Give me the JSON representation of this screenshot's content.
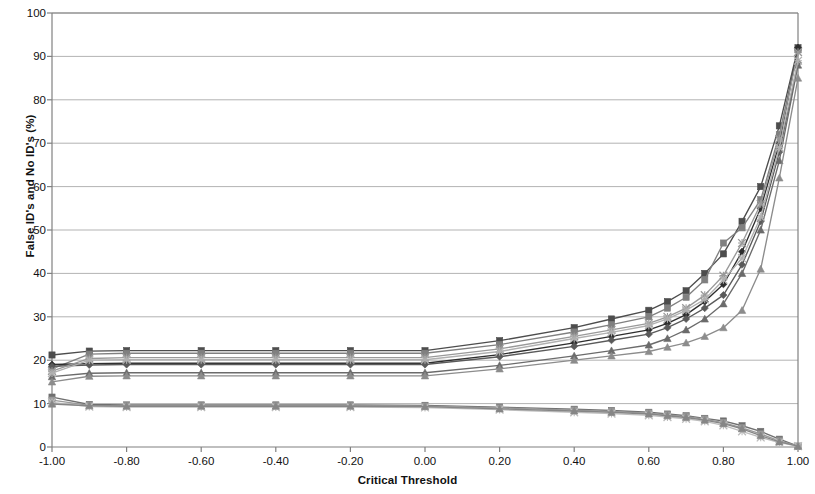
{
  "chart_data": {
    "type": "line",
    "title": "",
    "xlabel": "Critical Threshold",
    "ylabel": "False ID's and No ID's (%)",
    "xlim": [
      -1.0,
      1.0
    ],
    "ylim": [
      0,
      100
    ],
    "grid": "horizontal",
    "legend": "none",
    "xticks": [
      "-1.00",
      "-0.80",
      "-0.60",
      "-0.40",
      "-0.20",
      "0.00",
      "0.20",
      "0.40",
      "0.60",
      "0.80",
      "1.00"
    ],
    "xtick_values": [
      -1.0,
      -0.8,
      -0.6,
      -0.4,
      -0.2,
      0.0,
      0.2,
      0.4,
      0.6,
      0.8,
      1.0
    ],
    "yticks": [
      "0",
      "10",
      "20",
      "30",
      "40",
      "50",
      "60",
      "70",
      "80",
      "90",
      "100"
    ],
    "ytick_values": [
      0,
      10,
      20,
      30,
      40,
      50,
      60,
      70,
      80,
      90,
      100
    ],
    "x": [
      -1.0,
      -0.9,
      -0.8,
      -0.6,
      -0.4,
      -0.2,
      0.0,
      0.2,
      0.4,
      0.5,
      0.6,
      0.65,
      0.7,
      0.75,
      0.8,
      0.85,
      0.9,
      0.95,
      1.0
    ],
    "series": [
      {
        "name": "Series 1",
        "marker": "square",
        "color": "#4d4d4d",
        "values": [
          21.2,
          22.1,
          22.2,
          22.2,
          22.2,
          22.2,
          22.2,
          24.5,
          27.5,
          29.5,
          31.5,
          33.5,
          36.0,
          40.0,
          44.5,
          52.0,
          60.0,
          74.0,
          92.0
        ]
      },
      {
        "name": "Series 2",
        "marker": "square",
        "color": "#808080",
        "values": [
          18.0,
          21.4,
          21.6,
          21.6,
          21.6,
          21.6,
          21.6,
          23.6,
          26.5,
          28.2,
          30.0,
          32.0,
          34.5,
          38.5,
          47.0,
          50.5,
          57.0,
          72.0,
          91.5
        ]
      },
      {
        "name": "Series 3",
        "marker": "diamond",
        "color": "#2e2e2e",
        "values": [
          19.0,
          19.2,
          19.3,
          19.3,
          19.3,
          19.3,
          19.3,
          21.3,
          24.0,
          25.5,
          27.0,
          28.5,
          30.5,
          33.5,
          37.5,
          45.0,
          55.0,
          70.0,
          92.0
        ]
      },
      {
        "name": "Series 4",
        "marker": "diamond",
        "color": "#5a5a5a",
        "values": [
          18.6,
          18.9,
          19.0,
          19.0,
          19.0,
          19.0,
          19.0,
          20.8,
          23.2,
          24.6,
          26.0,
          27.5,
          29.5,
          32.0,
          35.0,
          42.0,
          52.0,
          68.0,
          88.5
        ]
      },
      {
        "name": "Series 5",
        "marker": "triangle",
        "color": "#6b6b6b",
        "values": [
          16.2,
          17.0,
          17.1,
          17.1,
          17.1,
          17.1,
          17.1,
          18.8,
          21.0,
          22.2,
          23.5,
          25.0,
          27.0,
          29.5,
          33.0,
          40.0,
          50.0,
          66.0,
          88.0
        ]
      },
      {
        "name": "Series 6",
        "marker": "triangle",
        "color": "#8c8c8c",
        "values": [
          15.0,
          16.3,
          16.4,
          16.4,
          16.4,
          16.4,
          16.4,
          18.0,
          20.0,
          21.0,
          22.0,
          23.0,
          24.0,
          25.5,
          27.5,
          31.5,
          41.0,
          62.0,
          85.0
        ]
      },
      {
        "name": "Series 7",
        "marker": "star",
        "color": "#999999",
        "values": [
          17.5,
          20.4,
          20.6,
          20.6,
          20.6,
          20.6,
          20.6,
          22.6,
          25.5,
          27.0,
          28.5,
          30.0,
          32.0,
          35.0,
          39.5,
          47.0,
          56.0,
          71.0,
          91.0
        ]
      },
      {
        "name": "Series 8",
        "marker": "star",
        "color": "#b0b0b0",
        "values": [
          17.0,
          20.0,
          20.1,
          20.1,
          20.1,
          20.1,
          20.1,
          22.0,
          25.0,
          26.4,
          28.0,
          29.5,
          31.5,
          34.0,
          38.5,
          43.5,
          53.0,
          69.0,
          89.0
        ]
      },
      {
        "name": "Series 9",
        "marker": "square",
        "color": "#707070",
        "values": [
          11.5,
          9.8,
          9.7,
          9.7,
          9.7,
          9.7,
          9.6,
          9.2,
          8.7,
          8.4,
          8.0,
          7.6,
          7.2,
          6.6,
          6.0,
          4.9,
          3.6,
          1.8,
          0.2
        ]
      },
      {
        "name": "Series 10",
        "marker": "square",
        "color": "#9a9a9a",
        "values": [
          10.8,
          9.6,
          9.5,
          9.5,
          9.5,
          9.5,
          9.4,
          9.0,
          8.5,
          8.2,
          7.8,
          7.4,
          7.0,
          6.4,
          5.6,
          4.4,
          3.0,
          1.4,
          0.2
        ]
      },
      {
        "name": "Series 11",
        "marker": "star",
        "color": "#bdbdbd",
        "values": [
          10.3,
          9.3,
          9.2,
          9.2,
          9.2,
          9.2,
          9.1,
          8.6,
          8.0,
          7.7,
          7.3,
          6.9,
          6.5,
          5.9,
          5.0,
          3.6,
          2.2,
          1.0,
          0.2
        ]
      },
      {
        "name": "Series 12",
        "marker": "triangle",
        "color": "#868686",
        "values": [
          9.9,
          9.5,
          9.4,
          9.4,
          9.4,
          9.4,
          9.3,
          8.8,
          8.3,
          8.0,
          7.6,
          7.2,
          6.8,
          6.2,
          5.4,
          4.2,
          2.6,
          1.2,
          0.2
        ]
      }
    ]
  },
  "style": {
    "axis_color": "#808080",
    "grid_color": "#b3b3b3",
    "text_color": "#111111",
    "background": "#ffffff"
  }
}
